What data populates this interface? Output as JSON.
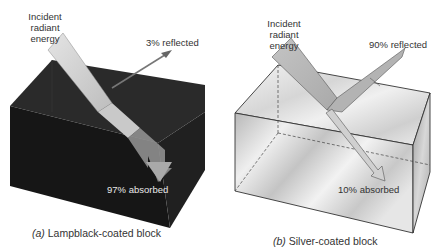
{
  "panels": [
    {
      "id": "a",
      "caption_letter": "(a)",
      "caption_text": " Lampblack-coated block",
      "incident_label": [
        "Incident",
        "radiant",
        "energy"
      ],
      "reflected_label": "3% reflected",
      "absorbed_label": "97% absorbed",
      "reflected_percent": 3,
      "absorbed_percent": 97,
      "block_color": "#1c1c1c"
    },
    {
      "id": "b",
      "caption_letter": "(b)",
      "caption_text": " Silver-coated block",
      "incident_label": [
        "Incident",
        "radiant",
        "energy"
      ],
      "reflected_label": "90% reflected",
      "absorbed_label": "10% absorbed",
      "reflected_percent": 90,
      "absorbed_percent": 10,
      "block_color": "#d8d8d8"
    }
  ]
}
